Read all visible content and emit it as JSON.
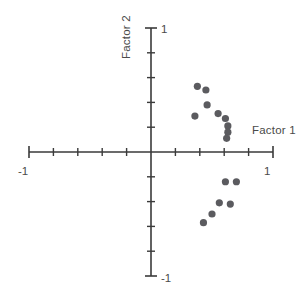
{
  "chart_data": {
    "type": "scatter",
    "title": "",
    "xlabel": "Factor 1",
    "ylabel": "Factor 2",
    "xlim": [
      -1,
      1
    ],
    "ylim": [
      -1,
      1
    ],
    "grid": false,
    "legend": null,
    "x_tick_labels": [
      "-1",
      "1"
    ],
    "y_tick_labels": [
      "1",
      "-1"
    ],
    "x_tick_step": 0.2,
    "y_tick_step": 0.2,
    "point_color": "#5b5b5f",
    "axis_color": "#3a3a3a",
    "series": [
      {
        "name": "loadings",
        "points": [
          {
            "x": 0.38,
            "y": 0.53
          },
          {
            "x": 0.45,
            "y": 0.5
          },
          {
            "x": 0.46,
            "y": 0.38
          },
          {
            "x": 0.36,
            "y": 0.29
          },
          {
            "x": 0.55,
            "y": 0.31
          },
          {
            "x": 0.61,
            "y": 0.27
          },
          {
            "x": 0.63,
            "y": 0.21
          },
          {
            "x": 0.63,
            "y": 0.16
          },
          {
            "x": 0.62,
            "y": 0.11
          },
          {
            "x": 0.61,
            "y": -0.24
          },
          {
            "x": 0.7,
            "y": -0.24
          },
          {
            "x": 0.56,
            "y": -0.41
          },
          {
            "x": 0.65,
            "y": -0.42
          },
          {
            "x": 0.5,
            "y": -0.5
          },
          {
            "x": 0.43,
            "y": -0.57
          }
        ]
      }
    ]
  },
  "labels": {
    "x_axis_title": "Factor 1",
    "y_axis_title": "Factor 2",
    "x_min_label": "-1",
    "x_max_label": "1",
    "y_max_label": "1",
    "y_min_label": "-1"
  }
}
